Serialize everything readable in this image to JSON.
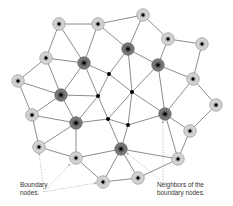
{
  "diagram": {
    "colors": {
      "edge": "#6e6e6e",
      "boundary_fill": "#d6d6d6",
      "boundary_ring": "#a0a0a0",
      "neighbor_fill": "#7a7a7a",
      "neighbor_ring": "#5a5a5a",
      "center_dot": "#000000",
      "annotation": "#b8b8b8"
    },
    "nodes": [
      {
        "id": "n0",
        "x": 59,
        "y": 24,
        "type": "boundary"
      },
      {
        "id": "n1",
        "x": 98,
        "y": 24,
        "type": "boundary"
      },
      {
        "id": "n2",
        "x": 143,
        "y": 15,
        "type": "boundary"
      },
      {
        "id": "n3",
        "x": 168,
        "y": 39,
        "type": "boundary"
      },
      {
        "id": "n4",
        "x": 202,
        "y": 44,
        "type": "boundary"
      },
      {
        "id": "n5",
        "x": 46,
        "y": 58,
        "type": "boundary"
      },
      {
        "id": "n6",
        "x": 18,
        "y": 81,
        "type": "boundary"
      },
      {
        "id": "n7",
        "x": 193,
        "y": 79,
        "type": "boundary"
      },
      {
        "id": "n8",
        "x": 216,
        "y": 105,
        "type": "boundary"
      },
      {
        "id": "n9",
        "x": 32,
        "y": 115,
        "type": "boundary"
      },
      {
        "id": "n10",
        "x": 190,
        "y": 131,
        "type": "boundary"
      },
      {
        "id": "n11",
        "x": 39,
        "y": 147,
        "type": "boundary"
      },
      {
        "id": "n12",
        "x": 76,
        "y": 158,
        "type": "boundary"
      },
      {
        "id": "n13",
        "x": 178,
        "y": 159,
        "type": "boundary"
      },
      {
        "id": "n14",
        "x": 103,
        "y": 182,
        "type": "boundary"
      },
      {
        "id": "n15",
        "x": 138,
        "y": 178,
        "type": "boundary"
      },
      {
        "id": "n16",
        "x": 84,
        "y": 63,
        "type": "neighbor"
      },
      {
        "id": "n17",
        "x": 128,
        "y": 49,
        "type": "neighbor"
      },
      {
        "id": "n18",
        "x": 158,
        "y": 65,
        "type": "neighbor"
      },
      {
        "id": "n19",
        "x": 61,
        "y": 95,
        "type": "neighbor"
      },
      {
        "id": "n20",
        "x": 76,
        "y": 123,
        "type": "neighbor"
      },
      {
        "id": "n21",
        "x": 165,
        "y": 114,
        "type": "neighbor"
      },
      {
        "id": "n22",
        "x": 121,
        "y": 149,
        "type": "neighbor"
      },
      {
        "id": "n23",
        "x": 109,
        "y": 74,
        "type": "interior"
      },
      {
        "id": "n24",
        "x": 132,
        "y": 92,
        "type": "interior"
      },
      {
        "id": "n25",
        "x": 98,
        "y": 96,
        "type": "interior"
      },
      {
        "id": "n26",
        "x": 108,
        "y": 119,
        "type": "interior"
      },
      {
        "id": "n27",
        "x": 128,
        "y": 125,
        "type": "interior"
      }
    ],
    "edges": [
      [
        "n0",
        "n1"
      ],
      [
        "n0",
        "n5"
      ],
      [
        "n0",
        "n16"
      ],
      [
        "n1",
        "n16"
      ],
      [
        "n1",
        "n2"
      ],
      [
        "n1",
        "n17"
      ],
      [
        "n2",
        "n17"
      ],
      [
        "n2",
        "n3"
      ],
      [
        "n3",
        "n4"
      ],
      [
        "n3",
        "n18"
      ],
      [
        "n4",
        "n7"
      ],
      [
        "n17",
        "n18"
      ],
      [
        "n18",
        "n7"
      ],
      [
        "n7",
        "n8"
      ],
      [
        "n7",
        "n21"
      ],
      [
        "n8",
        "n10"
      ],
      [
        "n21",
        "n10"
      ],
      [
        "n10",
        "n13"
      ],
      [
        "n21",
        "n13"
      ],
      [
        "n18",
        "n21"
      ],
      [
        "n18",
        "n24"
      ],
      [
        "n17",
        "n23"
      ],
      [
        "n17",
        "n24"
      ],
      [
        "n16",
        "n23"
      ],
      [
        "n23",
        "n24"
      ],
      [
        "n23",
        "n25"
      ],
      [
        "n16",
        "n25"
      ],
      [
        "n16",
        "n19"
      ],
      [
        "n5",
        "n16"
      ],
      [
        "n5",
        "n6"
      ],
      [
        "n5",
        "n19"
      ],
      [
        "n6",
        "n19"
      ],
      [
        "n6",
        "n9"
      ],
      [
        "n19",
        "n25"
      ],
      [
        "n19",
        "n9"
      ],
      [
        "n19",
        "n20"
      ],
      [
        "n9",
        "n20"
      ],
      [
        "n9",
        "n11"
      ],
      [
        "n11",
        "n20"
      ],
      [
        "n11",
        "n12"
      ],
      [
        "n20",
        "n12"
      ],
      [
        "n20",
        "n25"
      ],
      [
        "n20",
        "n26"
      ],
      [
        "n25",
        "n26"
      ],
      [
        "n24",
        "n26"
      ],
      [
        "n24",
        "n27"
      ],
      [
        "n24",
        "n21"
      ],
      [
        "n26",
        "n27"
      ],
      [
        "n27",
        "n21"
      ],
      [
        "n26",
        "n22"
      ],
      [
        "n27",
        "n22"
      ],
      [
        "n12",
        "n22"
      ],
      [
        "n12",
        "n14"
      ],
      [
        "n14",
        "n22"
      ],
      [
        "n14",
        "n15"
      ],
      [
        "n22",
        "n15"
      ],
      [
        "n22",
        "n13"
      ],
      [
        "n15",
        "n13"
      ]
    ],
    "annotations": [
      {
        "from": [
          44,
          192
        ],
        "to": [
          39,
          153
        ]
      },
      {
        "from": [
          44,
          192
        ],
        "to": [
          70,
          164
        ]
      },
      {
        "from": [
          44,
          192
        ],
        "to": [
          96,
          183
        ]
      },
      {
        "from": [
          163,
          183
        ],
        "to": [
          163,
          121
        ]
      },
      {
        "from": [
          160,
          180
        ],
        "to": [
          127,
          153
        ]
      }
    ],
    "labels": {
      "boundary": {
        "line1": "Boundary",
        "line2": "nodes."
      },
      "neighbors": {
        "line1": "Neighbors of the",
        "line2": "boundary nodes."
      }
    }
  }
}
